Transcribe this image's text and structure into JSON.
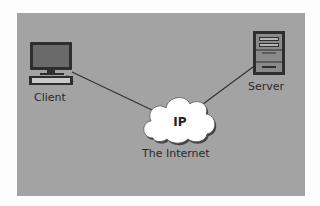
{
  "diagram": {
    "nodes": [
      {
        "id": "client",
        "label": "Client",
        "icon": "desktop-computer-icon"
      },
      {
        "id": "internet",
        "label": "The Internet",
        "icon": "cloud-icon",
        "inner_text": "IP"
      },
      {
        "id": "server",
        "label": "Server",
        "icon": "server-tower-icon"
      }
    ],
    "edges": [
      {
        "from": "client",
        "to": "internet"
      },
      {
        "from": "internet",
        "to": "server"
      }
    ]
  },
  "colors": {
    "background": "#a3a3a3",
    "line": "#333333",
    "cloud": "#ffffff"
  }
}
